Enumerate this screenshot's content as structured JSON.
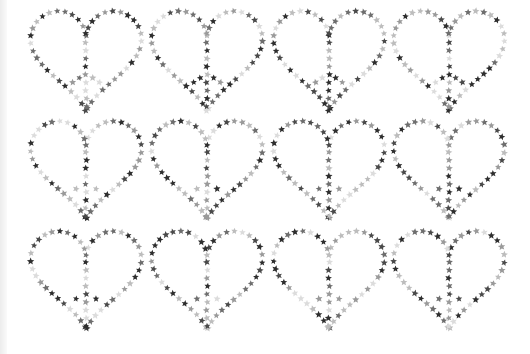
{
  "image": {
    "description": "Repeating pattern of heart-shaped peace signs made of small gray stars",
    "grid": {
      "rows": 3,
      "cols": 4
    },
    "motif": "heart-peace-sign-of-stars",
    "star_colors": [
      "#2e2e2e",
      "#4a4a4a",
      "#6e6e6e",
      "#9a9a9a",
      "#bdbdbd",
      "#dcdcdc"
    ],
    "background": "#ffffff",
    "hearts": [
      {
        "cx": 86,
        "top": 14,
        "w": 118,
        "h": 106
      },
      {
        "cx": 207,
        "top": 14,
        "w": 118,
        "h": 106
      },
      {
        "cx": 329,
        "top": 14,
        "w": 118,
        "h": 106
      },
      {
        "cx": 449,
        "top": 14,
        "w": 118,
        "h": 106
      },
      {
        "cx": 86,
        "top": 124,
        "w": 118,
        "h": 104
      },
      {
        "cx": 207,
        "top": 124,
        "w": 118,
        "h": 104
      },
      {
        "cx": 329,
        "top": 124,
        "w": 118,
        "h": 104
      },
      {
        "cx": 449,
        "top": 124,
        "w": 118,
        "h": 104
      },
      {
        "cx": 86,
        "top": 234,
        "w": 118,
        "h": 104
      },
      {
        "cx": 207,
        "top": 234,
        "w": 118,
        "h": 104
      },
      {
        "cx": 329,
        "top": 234,
        "w": 118,
        "h": 104
      },
      {
        "cx": 449,
        "top": 234,
        "w": 118,
        "h": 104
      }
    ]
  }
}
